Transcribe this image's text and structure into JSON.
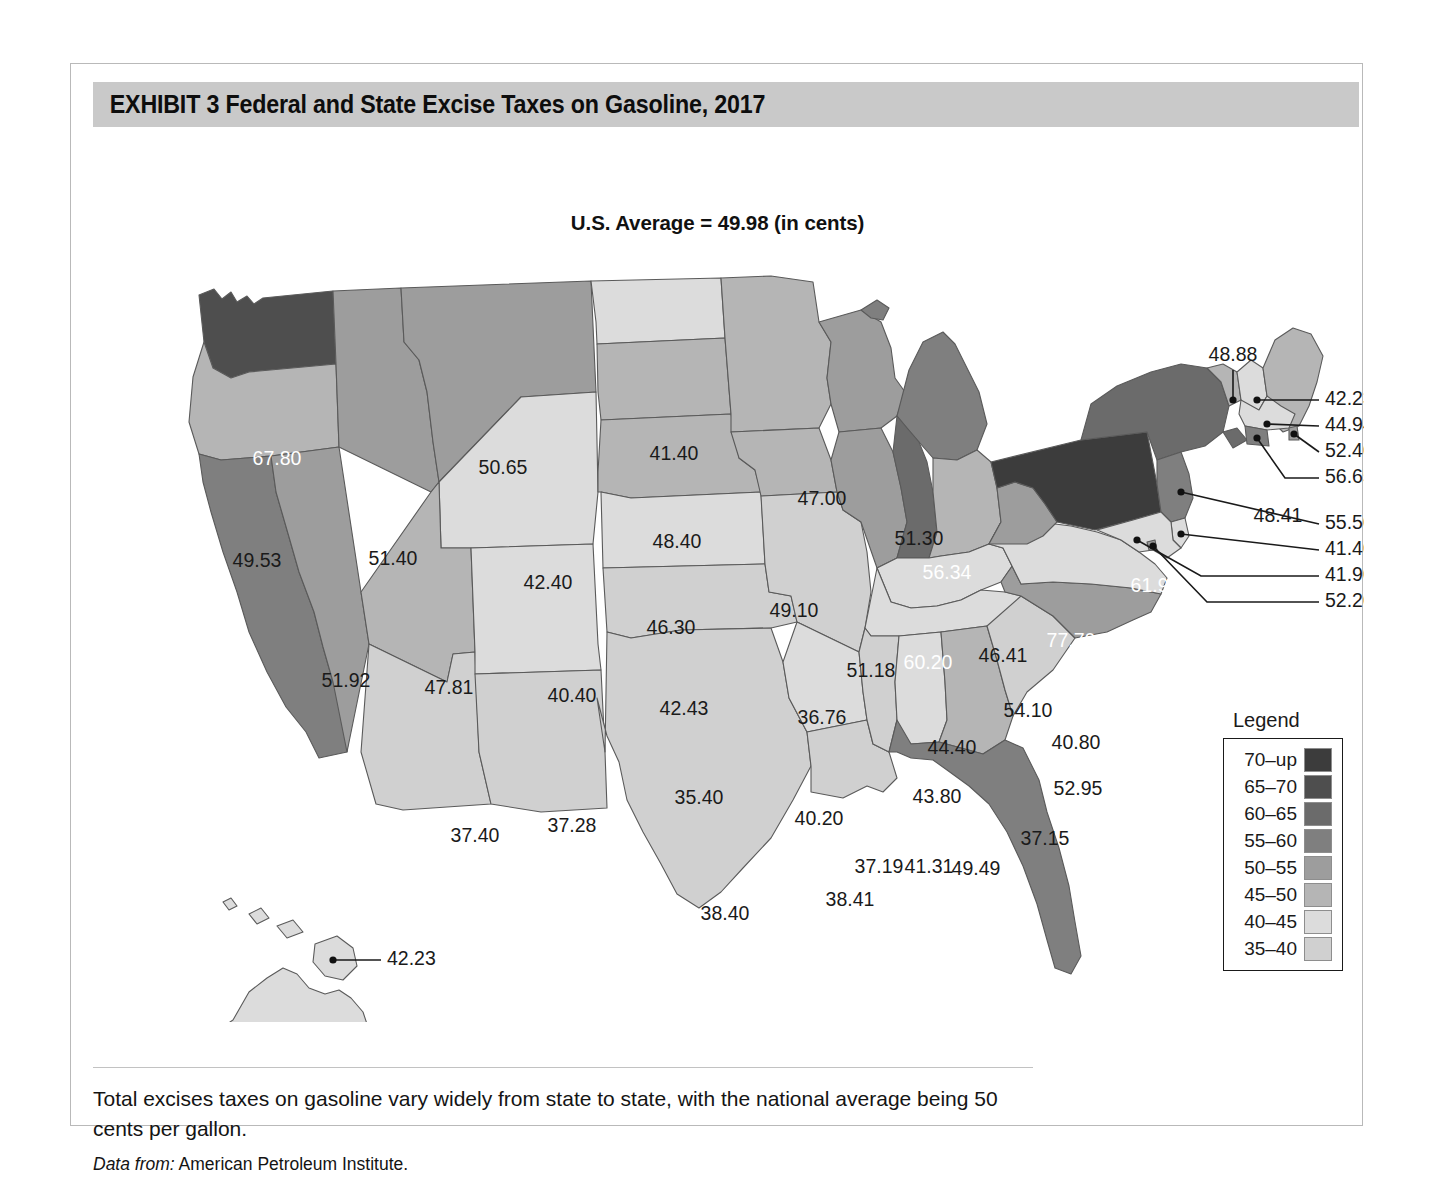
{
  "exhibit": {
    "title": "EXHIBIT 3  Federal and State Excise Taxes on Gasoline, 2017",
    "subtitle": "U.S. Average  = 49.98 (in cents)",
    "caption": "Total excises taxes on gasoline vary widely from state to state, with the national average being 50 cents per gallon.",
    "source_prefix": "Data from:",
    "source_text": "American Petroleum Institute."
  },
  "legend": {
    "title": "Legend",
    "items": [
      {
        "label": "70–up",
        "color": "#3c3c3c"
      },
      {
        "label": "65–70",
        "color": "#4e4e4e"
      },
      {
        "label": "60–65",
        "color": "#6b6b6b"
      },
      {
        "label": "55–60",
        "color": "#7f7f7f"
      },
      {
        "label": "50–55",
        "color": "#9d9d9d"
      },
      {
        "label": "45–50",
        "color": "#b5b5b5"
      },
      {
        "label": "40–45",
        "color": "#dcdcdc"
      },
      {
        "label": "35–40",
        "color": "#d0d0d0"
      }
    ]
  },
  "chart_data": {
    "type": "map",
    "title": "Federal and State Excise Taxes on Gasoline, 2017",
    "subtitle": "U.S. Average  = 49.98 (in cents)",
    "unit": "cents per gallon",
    "national_average": 49.98,
    "legend_position": "right",
    "bins": [
      "35-40",
      "40-45",
      "45-50",
      "50-55",
      "55-60",
      "60-65",
      "65-70",
      "70-up"
    ],
    "states": [
      {
        "code": "WA",
        "name": "Washington",
        "value": "67.80",
        "bin": "65-70"
      },
      {
        "code": "OR",
        "name": "Oregon",
        "value": "49.53",
        "bin": "45-50"
      },
      {
        "code": "CA",
        "name": "California",
        "value": "58.98",
        "bin": "55-60"
      },
      {
        "code": "NV",
        "name": "Nevada",
        "value": "51.92",
        "bin": "50-55"
      },
      {
        "code": "ID",
        "name": "Idaho",
        "value": "51.40",
        "bin": "50-55"
      },
      {
        "code": "MT",
        "name": "Montana",
        "value": "50.65",
        "bin": "50-55"
      },
      {
        "code": "WY",
        "name": "Wyoming",
        "value": "42.40",
        "bin": "40-45"
      },
      {
        "code": "UT",
        "name": "Utah",
        "value": "47.81",
        "bin": "45-50"
      },
      {
        "code": "AZ",
        "name": "Arizona",
        "value": "37.40",
        "bin": "35-40"
      },
      {
        "code": "NM",
        "name": "New Mexico",
        "value": "37.28",
        "bin": "35-40"
      },
      {
        "code": "CO",
        "name": "Colorado",
        "value": "40.40",
        "bin": "40-45"
      },
      {
        "code": "ND",
        "name": "North Dakota",
        "value": "41.40",
        "bin": "40-45"
      },
      {
        "code": "SD",
        "name": "South Dakota",
        "value": "48.40",
        "bin": "45-50"
      },
      {
        "code": "NE",
        "name": "Nebraska",
        "value": "46.30",
        "bin": "45-50"
      },
      {
        "code": "KS",
        "name": "Kansas",
        "value": "42.43",
        "bin": "40-45"
      },
      {
        "code": "OK",
        "name": "Oklahoma",
        "value": "35.40",
        "bin": "35-40"
      },
      {
        "code": "TX",
        "name": "Texas",
        "value": "38.40",
        "bin": "35-40"
      },
      {
        "code": "MN",
        "name": "Minnesota",
        "value": "47.00",
        "bin": "45-50"
      },
      {
        "code": "IA",
        "name": "Iowa",
        "value": "49.10",
        "bin": "45-50"
      },
      {
        "code": "MO",
        "name": "Missouri",
        "value": "36.76",
        "bin": "35-40"
      },
      {
        "code": "AR",
        "name": "Arkansas",
        "value": "40.20",
        "bin": "40-45"
      },
      {
        "code": "LA",
        "name": "Louisiana",
        "value": "38.41",
        "bin": "35-40"
      },
      {
        "code": "WI",
        "name": "Wisconsin",
        "value": "51.30",
        "bin": "50-55"
      },
      {
        "code": "IL",
        "name": "Illinois",
        "value": "51.18",
        "bin": "50-55"
      },
      {
        "code": "MI",
        "name": "Michigan",
        "value": "56.34",
        "bin": "55-60"
      },
      {
        "code": "IN",
        "name": "Indiana",
        "value": "60.20",
        "bin": "60-65"
      },
      {
        "code": "OH",
        "name": "Ohio",
        "value": "46.41",
        "bin": "45-50"
      },
      {
        "code": "KY",
        "name": "Kentucky",
        "value": "44.40",
        "bin": "40-45"
      },
      {
        "code": "TN",
        "name": "Tennessee",
        "value": "43.80",
        "bin": "40-45"
      },
      {
        "code": "MS",
        "name": "Mississippi",
        "value": "37.19",
        "bin": "35-40"
      },
      {
        "code": "AL",
        "name": "Alabama",
        "value": "41.31",
        "bin": "40-45"
      },
      {
        "code": "GA",
        "name": "Georgia",
        "value": "49.49",
        "bin": "45-50"
      },
      {
        "code": "FL",
        "name": "Florida",
        "value": "55.19",
        "bin": "55-60"
      },
      {
        "code": "SC",
        "name": "South Carolina",
        "value": "37.15",
        "bin": "35-40"
      },
      {
        "code": "NC",
        "name": "North Carolina",
        "value": "52.95",
        "bin": "50-55"
      },
      {
        "code": "VA",
        "name": "Virginia",
        "value": "40.80",
        "bin": "40-45"
      },
      {
        "code": "WV",
        "name": "West Virginia",
        "value": "54.10",
        "bin": "50-55"
      },
      {
        "code": "PA",
        "name": "Pennsylvania",
        "value": "77.70",
        "bin": "70-up"
      },
      {
        "code": "NY",
        "name": "New York",
        "value": "61.90",
        "bin": "60-65"
      },
      {
        "code": "VT",
        "name": "Vermont",
        "value": "48.88",
        "bin": "45-50"
      },
      {
        "code": "ME",
        "name": "Maine",
        "value": "48.41",
        "bin": "45-50"
      },
      {
        "code": "NH",
        "name": "New Hampshire",
        "value": "42.23",
        "bin": "40-45"
      },
      {
        "code": "MA",
        "name": "Massachusetts",
        "value": "44.94",
        "bin": "40-45"
      },
      {
        "code": "RI",
        "name": "Rhode Island",
        "value": "52.40",
        "bin": "50-55"
      },
      {
        "code": "CT",
        "name": "Connecticut",
        "value": "56.65",
        "bin": "55-60"
      },
      {
        "code": "NJ",
        "name": "New Jersey",
        "value": "55.50",
        "bin": "55-60"
      },
      {
        "code": "DE",
        "name": "Delaware",
        "value": "41.40",
        "bin": "40-45"
      },
      {
        "code": "MD",
        "name": "Maryland",
        "value": "41.90",
        "bin": "40-45"
      },
      {
        "code": "DC",
        "name": "District of Columbia",
        "value": "52.20",
        "bin": "50-55"
      },
      {
        "code": "HI",
        "name": "Hawaii",
        "value": "42.23",
        "bin": "40-45"
      },
      {
        "code": "AK",
        "name": "Alaska",
        "value": "41.31",
        "bin": "40-45"
      }
    ]
  }
}
